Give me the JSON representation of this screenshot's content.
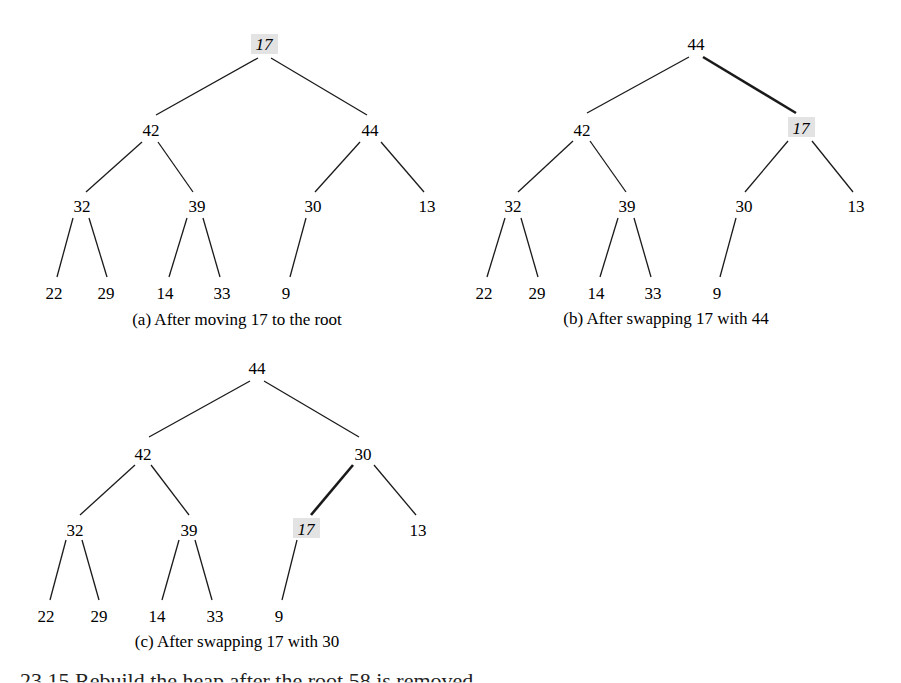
{
  "trees": [
    {
      "caption": "(a) After moving 17 to the root",
      "nodes": [
        "17",
        "42",
        "44",
        "32",
        "39",
        "30",
        "13",
        "22",
        "29",
        "14",
        "33",
        "9"
      ],
      "highlighted_node": "17",
      "bold_edge": null
    },
    {
      "caption": "(b) After swapping 17 with 44",
      "nodes": [
        "44",
        "42",
        "17",
        "32",
        "39",
        "30",
        "13",
        "22",
        "29",
        "14",
        "33",
        "9"
      ],
      "highlighted_node": "17",
      "bold_edge": [
        "44",
        "17"
      ]
    },
    {
      "caption": "(c) After swapping 17 with 30",
      "nodes": [
        "44",
        "42",
        "30",
        "32",
        "39",
        "17",
        "13",
        "22",
        "29",
        "14",
        "33",
        "9"
      ],
      "highlighted_node": "17",
      "bold_edge": [
        "30",
        "17"
      ]
    }
  ],
  "colors": {
    "highlight": "#e3e3e3",
    "line": "#1a1a1a"
  },
  "footer_partial": "23.15   Rebuild the heap after the root 58 is removed"
}
